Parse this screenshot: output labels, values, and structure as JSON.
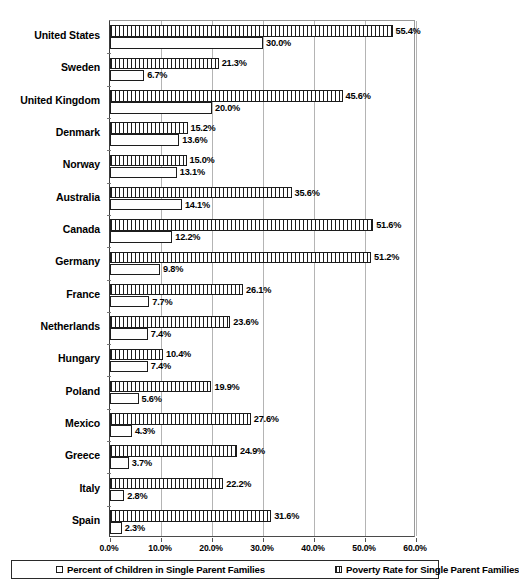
{
  "chart_data": {
    "type": "bar",
    "orientation": "horizontal",
    "title": "",
    "xlabel": "",
    "ylabel": "",
    "xlim": [
      0,
      60
    ],
    "xticks": [
      "0.0%",
      "10.0%",
      "20.0%",
      "30.0%",
      "40.0%",
      "50.0%",
      "60.0%"
    ],
    "xtick_values": [
      0,
      10,
      20,
      30,
      40,
      50,
      60
    ],
    "grid": true,
    "legend_position": "bottom",
    "categories": [
      "United States",
      "Sweden",
      "United Kingdom",
      "Denmark",
      "Norway",
      "Australia",
      "Canada",
      "Germany",
      "France",
      "Netherlands",
      "Hungary",
      "Poland",
      "Mexico",
      "Greece",
      "Italy",
      "Spain"
    ],
    "series": [
      {
        "name": "Poverty Rate for Single Parent Families",
        "style": "hatched",
        "values": [
          55.4,
          21.3,
          45.6,
          15.2,
          15.0,
          35.6,
          51.6,
          51.2,
          26.1,
          23.6,
          10.4,
          19.9,
          27.6,
          24.9,
          22.2,
          31.6
        ],
        "labels": [
          "55.4%",
          "21.3%",
          "45.6%",
          "15.2%",
          "15.0%",
          "35.6%",
          "51.6%",
          "51.2%",
          "26.1%",
          "23.6%",
          "10.4%",
          "19.9%",
          "27.6%",
          "24.9%",
          "22.2%",
          "31.6%"
        ]
      },
      {
        "name": "Percent of Children in Single Parent Families",
        "style": "empty",
        "values": [
          30.0,
          6.7,
          20.0,
          13.6,
          13.1,
          14.1,
          12.2,
          9.8,
          7.7,
          7.4,
          7.4,
          5.6,
          4.3,
          3.7,
          2.8,
          2.3
        ],
        "labels": [
          "30.0%",
          "6.7%",
          "20.0%",
          "13.6%",
          "13.1%",
          "14.1%",
          "12.2%",
          "9.8%",
          "7.7%",
          "7.4%",
          "7.4%",
          "5.6%",
          "4.3%",
          "3.7%",
          "2.8%",
          "2.3%"
        ]
      }
    ]
  },
  "legend": {
    "items": [
      {
        "label": "Percent of Children in Single Parent Families",
        "swatch": "empty-square-icon"
      },
      {
        "label": "Poverty Rate for Single Parent Families",
        "swatch": "hatched-square-icon"
      }
    ]
  },
  "colors": {
    "bar_outline": "#1c1c1c",
    "bar_fill": "#ffffff",
    "gridline": "#b4b4b4",
    "axis": "#3a3a3a",
    "text": "#000000"
  }
}
